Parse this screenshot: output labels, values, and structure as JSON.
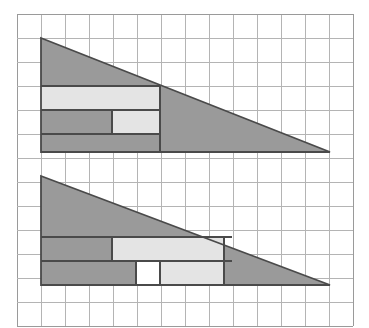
{
  "figure": {
    "canvas": {
      "width": 369,
      "height": 328,
      "background": "#ffffff"
    }
  },
  "grid": {
    "origin_x": 17,
    "origin_y": 14,
    "cell": 24,
    "cols": 14,
    "rows": 13,
    "line_color": "#b4b4b4",
    "line_width": 1,
    "border_color": "#9a9a9a"
  },
  "palette": {
    "dark_fill": "#9a9a9a",
    "light_fill": "#e4e4e4",
    "white_fill": "#ffffff",
    "outline": "#4a4a4a",
    "outline_width": 1.8
  },
  "shapes": {
    "top_triangle": {
      "name": "top-triangle",
      "apex": {
        "col": 1,
        "row": 1
      },
      "right_vertex": {
        "col": 13,
        "row": 5.75
      },
      "base_row": 5.75,
      "points_px": "41,38 330,152 41,152",
      "fill": "#9a9a9a",
      "light_regions": [
        {
          "name": "top-light-band",
          "x_px": 41,
          "y_px": 86,
          "w_px": 119,
          "h_px": 24
        },
        {
          "name": "top-light-block",
          "x_px": 112,
          "y_px": 110,
          "w_px": 48,
          "h_px": 24
        }
      ],
      "inner_lines_px": [
        "41,86 160,86",
        "41,110 160,110",
        "41,134 160,134",
        "160,86 160,152",
        "112,110 112,134"
      ]
    },
    "bottom_triangle": {
      "name": "bottom-triangle",
      "apex": {
        "col": 1,
        "row": 6.75
      },
      "right_vertex": {
        "col": 13,
        "row": 11.3
      },
      "base_row": 11.3,
      "points_px": "41,176 330,285 41,285",
      "fill": "#9a9a9a",
      "light_regions": [
        {
          "name": "bottom-light-band",
          "x_px": 112,
          "y_px": 237,
          "w_px": 112,
          "h_px": 24
        },
        {
          "name": "bottom-light-block",
          "x_px": 160,
          "y_px": 261,
          "w_px": 64,
          "h_px": 24
        }
      ],
      "white_regions": [
        {
          "name": "bottom-white-notch",
          "x_px": 136,
          "y_px": 261,
          "w_px": 24,
          "h_px": 24
        }
      ],
      "inner_lines_px": [
        "41,237 232,237",
        "41,261 232,261",
        "41,285 232,285",
        "112,237 112,261",
        "136,261 136,285",
        "160,261 160,285",
        "224,237 224,285"
      ]
    }
  },
  "labels": {
    "caption": "",
    "notes": ""
  }
}
